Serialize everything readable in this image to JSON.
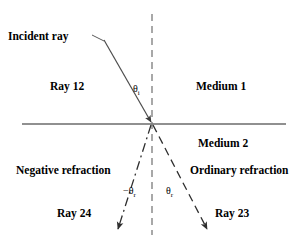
{
  "diagram": {
    "labels": {
      "incident_ray": "Incident ray",
      "ray_12": "Ray 12",
      "medium_1": "Medium 1",
      "medium_2": "Medium 2",
      "negative_refraction": "Negative refraction",
      "ordinary_refraction": "Ordinary refraction",
      "ray_24": "Ray 24",
      "ray_23": "Ray 23"
    },
    "angles": {
      "theta_incident_symbol": "θ",
      "theta_incident_subscript": "i",
      "theta_refracted_negative_symbol": "−θ",
      "theta_refracted_negative_subscript": "r",
      "theta_refracted_positive_symbol": "θ",
      "theta_refracted_positive_subscript": "r"
    },
    "colors": {
      "line": "#4d4d4d",
      "interface": "#6b6b6b",
      "normal": "#7a7a7a",
      "text": "#000000",
      "background": "#ffffff"
    },
    "geometry": {
      "interface_y": 124,
      "interface_x_start": 22,
      "interface_x_end": 286,
      "normal_x": 152,
      "normal_y_start": 14,
      "normal_y_end": 235,
      "origin_x": 152,
      "origin_y": 123,
      "incident_start_x": 104,
      "incident_start_y": 40,
      "ray23_end_x": 208,
      "ray23_end_y": 232,
      "ray24_end_x": 117,
      "ray24_end_y": 232
    }
  }
}
